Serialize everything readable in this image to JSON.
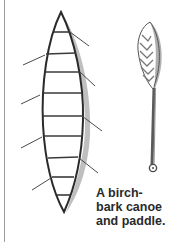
{
  "figure": {
    "caption_lines": [
      "A birch-",
      "bark canoe",
      "and paddle."
    ],
    "colors": {
      "ink": "#2a2a2a",
      "shading": "#7a7a7a",
      "border": "#9a9a9a",
      "background": "#ffffff"
    }
  }
}
